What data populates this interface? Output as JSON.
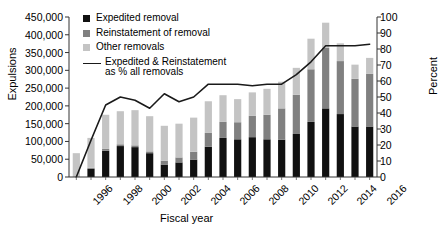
{
  "chart_data": {
    "type": "bar",
    "subtype": "stacked-bar-with-line",
    "title": "",
    "xlabel": "Fiscal year",
    "ylabel": "Expulsions",
    "y2label": "Percent",
    "grid": false,
    "legend_position": "top-left-inside",
    "ylim": [
      0,
      450000
    ],
    "y2lim": [
      0,
      100
    ],
    "ytick_labels": [
      "0",
      "50,000",
      "100,000",
      "150,000",
      "200,000",
      "250,000",
      "300,000",
      "350,000",
      "400,000",
      "450,000"
    ],
    "ytick_values": [
      0,
      50000,
      100000,
      150000,
      200000,
      250000,
      300000,
      350000,
      400000,
      450000
    ],
    "y2tick_labels": [
      "0",
      "10",
      "20",
      "30",
      "40",
      "50",
      "60",
      "70",
      "80",
      "90",
      "100"
    ],
    "y2tick_values": [
      0,
      10,
      20,
      30,
      40,
      50,
      60,
      70,
      80,
      90,
      100
    ],
    "categories": [
      1996,
      1997,
      1998,
      1999,
      2000,
      2001,
      2002,
      2003,
      2004,
      2005,
      2006,
      2007,
      2008,
      2009,
      2010,
      2011,
      2012,
      2013,
      2014,
      2015,
      2016
    ],
    "xtick_labels": [
      "1996",
      "1998",
      "2000",
      "2002",
      "2004",
      "2006",
      "2008",
      "2010",
      "2012",
      "2014",
      "2016"
    ],
    "xtick_values": [
      1996,
      1998,
      2000,
      2002,
      2004,
      2006,
      2008,
      2010,
      2012,
      2014,
      2016
    ],
    "series": [
      {
        "name": "Expedited removal",
        "color": "#111111",
        "values": [
          0,
          23000,
          74000,
          87000,
          84000,
          67000,
          35000,
          41000,
          49000,
          85000,
          110000,
          106000,
          112000,
          106000,
          105000,
          121000,
          155000,
          193000,
          177000,
          142000,
          142000
        ]
      },
      {
        "name": "Reinstatement of removal",
        "color": "#808080",
        "values": [
          0,
          3000,
          5000,
          5000,
          5000,
          5000,
          11000,
          14000,
          22000,
          39000,
          45000,
          48000,
          60000,
          69000,
          88000,
          110000,
          148000,
          170000,
          149000,
          134000,
          148000
        ]
      },
      {
        "name": "Other removals",
        "color": "#c4c4c4",
        "values": [
          67000,
          84000,
          96000,
          93000,
          99000,
          99000,
          98000,
          95000,
          96000,
          89000,
          75000,
          65000,
          66000,
          73000,
          75000,
          76000,
          86000,
          71000,
          50000,
          40000,
          45000
        ]
      }
    ],
    "line_series": {
      "name": "Expedited & Reinstatement as % all removals",
      "color": "#1a1a1a",
      "y_axis": "right",
      "values": [
        0,
        23,
        45,
        50,
        48,
        43,
        52,
        47,
        50,
        58,
        58,
        58,
        57,
        58,
        58,
        64,
        72,
        82,
        82,
        82,
        83
      ]
    },
    "legend": [
      {
        "label": "Expedited removal",
        "type": "swatch",
        "color": "#111111"
      },
      {
        "label": "Reinstatement of removal",
        "type": "swatch",
        "color": "#808080"
      },
      {
        "label": "Other removals",
        "type": "swatch",
        "color": "#c4c4c4"
      },
      {
        "label": "Expedited & Reinstatement",
        "label2": "as % all removals",
        "type": "line",
        "color": "#1a1a1a"
      }
    ]
  },
  "axes": {
    "left_title": "Expulsions",
    "right_title": "Percent",
    "bottom_title": "Fiscal year"
  },
  "legend_text": {
    "expedited": "Expedited removal",
    "reinstatement": "Reinstatement of removal",
    "other": "Other removals",
    "line_1": "Expedited & Reinstatement",
    "line_2": "as % all removals"
  }
}
